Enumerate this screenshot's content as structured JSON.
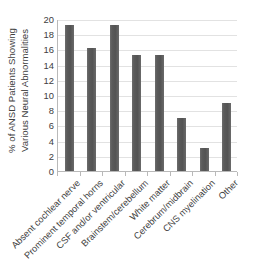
{
  "chart_data": {
    "type": "bar",
    "title": "",
    "subtitle": "",
    "xlabel": "",
    "ylabel": "% of ANSD Patients Showing Various Neural Abnormalities",
    "ylabel_line1": "% of ANSD Patients Showing",
    "ylabel_line2": "Various Neural Abnormalities",
    "categories": [
      "Absent cochlear nerve",
      "Prominent temporal horns",
      "CSF and/or ventricular",
      "Brainstem/cerebellum",
      "White matter",
      "Cerebrum/midbrain",
      "CNS myelination",
      "Other"
    ],
    "values": [
      19.2,
      16.2,
      19.2,
      15.2,
      15.2,
      7.0,
      3.0,
      9.0
    ],
    "ylim": [
      0,
      20
    ],
    "ytick_labels": [
      "20",
      "18",
      "16",
      "14",
      "12",
      "10",
      "8",
      "6",
      "4",
      "2",
      "0"
    ],
    "ytick_values": [
      20,
      18,
      16,
      14,
      12,
      10,
      8,
      6,
      4,
      2,
      0
    ],
    "ytick_interval": 2,
    "grid": true,
    "grid_axis": "y",
    "legend": false,
    "legend_position": "none",
    "bar_color": "#595959",
    "gridline_color": "#e2e2e2",
    "axis_color": "#b9b9b9",
    "text_color": "#3f3f3f",
    "background_color": "#ffffff",
    "xtick_rotation": -45
  }
}
